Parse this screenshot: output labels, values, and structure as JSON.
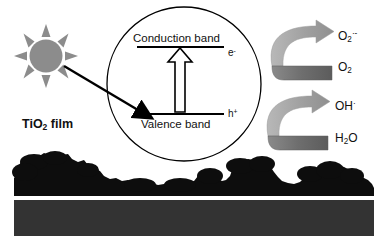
{
  "figure": {
    "background_color": "#ffffff"
  },
  "film": {
    "label_text": "TiO",
    "label_sub": "2",
    "label_suffix": " film",
    "film_color": "#0d0d0d",
    "substrate_color": "#333333"
  },
  "sun": {
    "name": "sun",
    "color": "#8c8c8c",
    "ray_count": 8
  },
  "excitation_arrow": {
    "color": "#000000"
  },
  "circle": {
    "stroke": "#000000"
  },
  "bands": {
    "conduction_label": "Conduction band",
    "valence_label": "Valence band",
    "electron_symbol": "e",
    "electron_charge": "-",
    "hole_symbol": "h",
    "hole_charge": "+",
    "line_color": "#000000",
    "transition_arrow_fill": "#ffffff",
    "transition_arrow_stroke": "#000000"
  },
  "reactions": [
    {
      "name": "oxygen-reduction",
      "product": "O",
      "product_sub": "2",
      "product_sup": "·-",
      "reactant": "O",
      "reactant_sub": "2",
      "arrow_top_color": "#a6a6a6",
      "arrow_bottom_color": "#6b6b6b"
    },
    {
      "name": "water-oxidation",
      "product": "OH",
      "product_sup": "·",
      "reactant": "H",
      "reactant_sub": "2",
      "reactant_suffix": "O",
      "arrow_top_color": "#a6a6a6",
      "arrow_bottom_color": "#6b6b6b"
    }
  ]
}
